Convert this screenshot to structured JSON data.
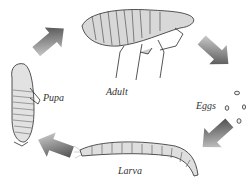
{
  "diagram": {
    "stages": [
      {
        "id": "adult",
        "label": "Adult"
      },
      {
        "id": "eggs",
        "label": "Eggs"
      },
      {
        "id": "larva",
        "label": "Larva"
      },
      {
        "id": "pupa",
        "label": "Pupa"
      }
    ],
    "cycle_order": [
      "Adult",
      "Eggs",
      "Larva",
      "Pupa",
      "Adult"
    ],
    "colors": {
      "arrow_dark": "#3a3a3a",
      "arrow_light": "#dcdcdc",
      "ink": "#2a2a2a",
      "background": "#ffffff"
    }
  }
}
